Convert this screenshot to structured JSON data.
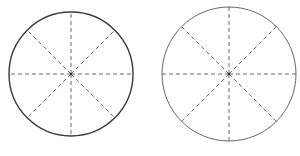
{
  "figure": {
    "diagrams": [
      {
        "name": "left-circle",
        "sectors": 8,
        "divider_style": "dashed",
        "outline": "bold"
      },
      {
        "name": "right-circle",
        "sectors": 8,
        "divider_style": "dashed",
        "outline": "thin"
      }
    ],
    "colors": {
      "line": "#3a3a3a",
      "background": "#ffffff"
    }
  }
}
